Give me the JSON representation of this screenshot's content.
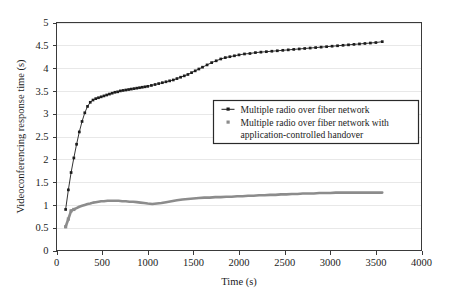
{
  "chart_data": {
    "type": "line",
    "title": "",
    "xlabel": "Time (s)",
    "ylabel": "Videoconferencing response time (s)",
    "xlim": [
      0,
      4000
    ],
    "ylim": [
      0,
      5
    ],
    "xticks": [
      0,
      500,
      1000,
      1500,
      2000,
      2500,
      3000,
      3500,
      4000
    ],
    "xtick_labels": [
      "0",
      "500",
      "1000",
      "1500",
      "2000",
      "2500",
      "3000",
      "3500",
      "4000"
    ],
    "yticks": [
      0,
      0.5,
      1,
      1.5,
      2,
      2.5,
      3,
      3.5,
      4,
      4.5,
      5
    ],
    "ytick_labels": [
      "0",
      "0.5",
      "1",
      "1.5",
      "2",
      "2.5",
      "3",
      "3.5",
      "4",
      "4.5",
      "5"
    ],
    "grid": "horizontal",
    "legend_position": "center-right",
    "series": [
      {
        "name": "Multiple radio over fiber network",
        "color": "#1c1c1c",
        "marker": "square",
        "x": [
          100,
          130,
          160,
          190,
          220,
          250,
          280,
          310,
          340,
          370,
          400,
          430,
          460,
          490,
          520,
          550,
          580,
          610,
          640,
          670,
          700,
          730,
          760,
          790,
          820,
          850,
          880,
          910,
          940,
          970,
          1000,
          1040,
          1080,
          1120,
          1160,
          1200,
          1240,
          1280,
          1320,
          1360,
          1400,
          1440,
          1480,
          1520,
          1560,
          1600,
          1650,
          1700,
          1750,
          1800,
          1850,
          1900,
          1950,
          2000,
          2060,
          2120,
          2180,
          2240,
          2300,
          2360,
          2420,
          2480,
          2540,
          2600,
          2660,
          2720,
          2780,
          2840,
          2900,
          2960,
          3020,
          3080,
          3140,
          3200,
          3260,
          3320,
          3380,
          3440,
          3500,
          3570
        ],
        "y": [
          0.9,
          1.33,
          1.71,
          2.03,
          2.33,
          2.6,
          2.83,
          3.02,
          3.16,
          3.25,
          3.3,
          3.33,
          3.35,
          3.37,
          3.39,
          3.41,
          3.43,
          3.45,
          3.47,
          3.48,
          3.5,
          3.51,
          3.52,
          3.53,
          3.54,
          3.55,
          3.56,
          3.57,
          3.58,
          3.59,
          3.6,
          3.62,
          3.64,
          3.66,
          3.68,
          3.7,
          3.72,
          3.74,
          3.77,
          3.8,
          3.83,
          3.86,
          3.9,
          3.94,
          3.98,
          4.02,
          4.07,
          4.12,
          4.16,
          4.2,
          4.23,
          4.25,
          4.27,
          4.29,
          4.31,
          4.32,
          4.34,
          4.35,
          4.36,
          4.37,
          4.38,
          4.39,
          4.4,
          4.41,
          4.42,
          4.43,
          4.44,
          4.45,
          4.46,
          4.47,
          4.48,
          4.49,
          4.5,
          4.51,
          4.52,
          4.53,
          4.54,
          4.55,
          4.56,
          4.58
        ]
      },
      {
        "name": "Multiple radio over fiber network with application-controlled handover",
        "color": "#8c8c8c",
        "marker": "square",
        "x": [
          100,
          130,
          160,
          190,
          220,
          250,
          280,
          310,
          340,
          370,
          400,
          430,
          460,
          490,
          520,
          560,
          600,
          640,
          680,
          720,
          760,
          800,
          840,
          880,
          920,
          960,
          1000,
          1050,
          1100,
          1150,
          1200,
          1260,
          1320,
          1380,
          1440,
          1500,
          1560,
          1620,
          1680,
          1740,
          1800,
          1860,
          1920,
          1980,
          2040,
          2100,
          2160,
          2220,
          2280,
          2340,
          2400,
          2460,
          2520,
          2580,
          2640,
          2700,
          2760,
          2820,
          2880,
          2940,
          3000,
          3060,
          3120,
          3180,
          3240,
          3300,
          3360,
          3420,
          3480,
          3570
        ],
        "y": [
          0.52,
          0.69,
          0.87,
          0.9,
          0.93,
          0.96,
          0.98,
          1.0,
          1.02,
          1.03,
          1.05,
          1.06,
          1.07,
          1.08,
          1.08,
          1.09,
          1.09,
          1.09,
          1.09,
          1.08,
          1.08,
          1.07,
          1.07,
          1.06,
          1.05,
          1.04,
          1.03,
          1.02,
          1.03,
          1.04,
          1.06,
          1.08,
          1.1,
          1.12,
          1.13,
          1.14,
          1.15,
          1.16,
          1.16,
          1.17,
          1.17,
          1.18,
          1.18,
          1.19,
          1.19,
          1.2,
          1.2,
          1.21,
          1.21,
          1.22,
          1.22,
          1.23,
          1.23,
          1.24,
          1.24,
          1.25,
          1.25,
          1.25,
          1.26,
          1.26,
          1.26,
          1.27,
          1.27,
          1.27,
          1.27,
          1.27,
          1.27,
          1.27,
          1.27,
          1.27
        ]
      }
    ],
    "legend": [
      {
        "label": "Multiple radio over fiber network",
        "color": "#1c1c1c"
      },
      {
        "label": "Multiple radio over fiber network with",
        "color": "#8c8c8c"
      },
      {
        "label": "application-controlled handover",
        "color": "#8c8c8c"
      }
    ]
  }
}
